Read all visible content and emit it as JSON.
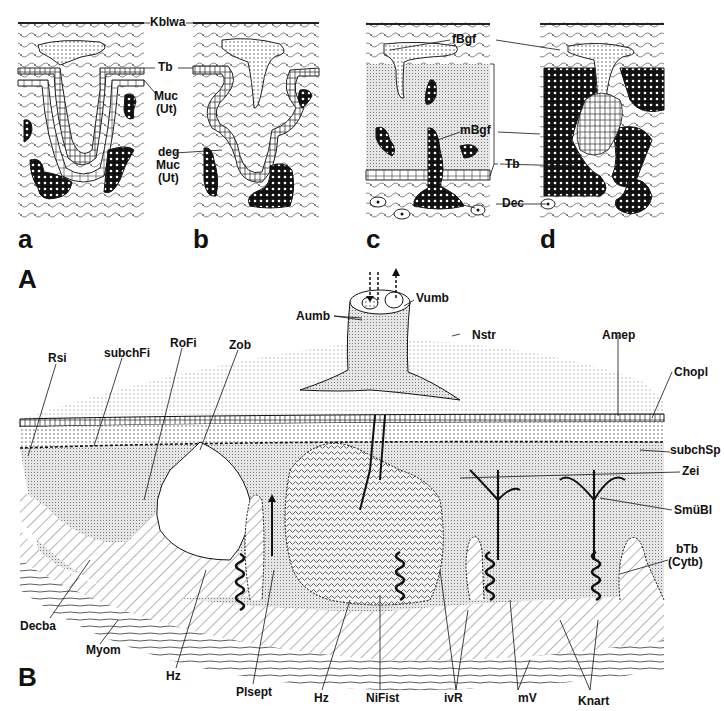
{
  "figure": {
    "part_A": {
      "letter": "A",
      "panels": [
        {
          "letter": "a"
        },
        {
          "letter": "b"
        },
        {
          "letter": "c"
        },
        {
          "letter": "d"
        }
      ],
      "labels": {
        "Kblwa": "Kblwa",
        "Tb_ab": "Tb",
        "Muc_Ut_1": "Muc",
        "Muc_Ut_2": "(Ut)",
        "deg_1": "deg",
        "deg_2": "Muc",
        "deg_3": "(Ut)",
        "fBgf": "fBgf",
        "mBgf": "mBgf",
        "Tb_cd": "Tb",
        "Dec": "Dec"
      }
    },
    "part_B": {
      "letter": "B",
      "labels": {
        "Aumb": "Aumb",
        "Vumb": "Vumb",
        "Nstr": "Nstr",
        "Rsi": "Rsi",
        "subchFi": "subchFi",
        "RoFi": "RoFi",
        "Zob": "Zob",
        "Amep": "Amep",
        "Chopl": "Chopl",
        "subchSp": "subchSp",
        "Zei": "Zei",
        "SmuBl": "SmüBl",
        "bTb": "bTb",
        "Cytb": "(Cytb)",
        "Decba": "Decba",
        "Myom": "Myom",
        "Hz_1": "Hz",
        "Plsept": "Plsept",
        "Hz_2": "Hz",
        "NiFist": "NiFist",
        "ivR": "ivR",
        "mV": "mV",
        "Knart": "Knart"
      }
    }
  }
}
